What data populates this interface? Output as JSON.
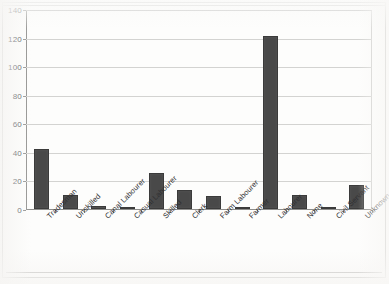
{
  "chart_data": {
    "type": "bar",
    "title": "",
    "subtitle": "",
    "xlabel": "",
    "ylabel": "",
    "ylim": [
      0,
      140
    ],
    "ytick_values": [
      0,
      20,
      40,
      60,
      80,
      100,
      120,
      140
    ],
    "ytick_labels": [
      "0",
      "20",
      "40",
      "60",
      "80",
      "100",
      "120",
      "140"
    ],
    "grid": true,
    "legend": false,
    "legend_position": "none",
    "categories": [
      "Tradesman",
      "Unskilled",
      "Canal Labourer",
      "Casual Labourer",
      "Skilled",
      "Clerk",
      "Farm Labourer",
      "Farmer",
      "Labourer",
      "None",
      "Civil Servant",
      "Unknown"
    ],
    "values": [
      42,
      10,
      2,
      1,
      25,
      13,
      9,
      1,
      121,
      10,
      1,
      17
    ],
    "bar_color": "#494949",
    "gridline_color": "#d3d3d1",
    "axis_color": "#8d8d8b"
  }
}
